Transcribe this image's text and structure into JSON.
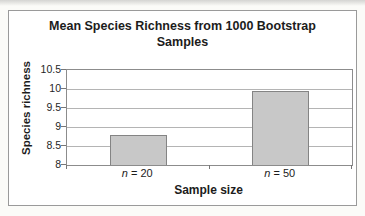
{
  "window": {
    "width": 365,
    "height": 216,
    "background": "#fbfbf8"
  },
  "chart_data": {
    "type": "bar",
    "title": "Mean Species Richness from 1000 Bootstrap Samples",
    "categories": [
      "n = 20",
      "n = 50"
    ],
    "values": [
      8.8,
      9.95
    ],
    "xlabel": "Sample size",
    "ylabel": "Species richness",
    "ylim": [
      8,
      10.5
    ],
    "ytick_step": 0.5,
    "ytick_labels": [
      "8",
      "8.5",
      "9",
      "9.5",
      "10",
      "10.5"
    ],
    "grid": true,
    "legend": "none",
    "colors": {
      "bar_fill": "#c8c8c8",
      "bar_border": "#848484",
      "gridline": "#b4b4b4",
      "plot_border": "#8c8c8c",
      "chart_border": "#9a9a9a",
      "axis_text": "#1f1f1f",
      "tick_mark": "#777777",
      "plot_bg": "#ffffff",
      "chart_bg": "#ffffff"
    }
  }
}
